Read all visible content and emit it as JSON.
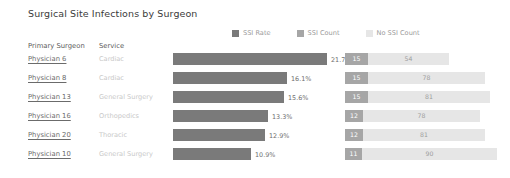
{
  "title": "Surgical Site Infections by Surgeon",
  "legend": {
    "items": [
      {
        "label": "SSI Rate",
        "color": "#7a7a7a"
      },
      {
        "label": "SSI Count",
        "color": "#a6a6a6"
      },
      {
        "label": "No SSI Count",
        "color": "#e6e6e6"
      }
    ]
  },
  "columns": {
    "surgeon": "Primary Surgeon",
    "service": "Service"
  },
  "chart_data": {
    "type": "bar",
    "title": "Surgical Site Infections by Surgeon",
    "xlabel": "",
    "ylabel": "",
    "categories": [
      "Physician 6",
      "Physician 8",
      "Physician 13",
      "Physician 16",
      "Physician 20",
      "Physician 10"
    ],
    "services": [
      "Cardiac",
      "Cardiac",
      "General Surgery",
      "Orthopedics",
      "Thoracic",
      "General Surgery"
    ],
    "series": [
      {
        "name": "SSI Rate",
        "values": [
          21.7,
          16.1,
          15.6,
          13.3,
          12.9,
          10.9
        ],
        "labels": [
          "21.7%",
          "16.1%",
          "15.6%",
          "13.3%",
          "12.9%",
          "10.9%"
        ],
        "color": "#7a7a7a",
        "unit": "%"
      },
      {
        "name": "SSI Count",
        "values": [
          15,
          15,
          15,
          12,
          12,
          11
        ],
        "color": "#a6a6a6"
      },
      {
        "name": "No SSI Count",
        "values": [
          54,
          78,
          81,
          78,
          81,
          90
        ],
        "color": "#e6e6e6"
      }
    ],
    "rate_axis_max": 22.5,
    "count_axis_max": 101,
    "grid": false,
    "legend_position": "top-right"
  },
  "rows": [
    {
      "surgeon": "Physician 6",
      "service": "Cardiac",
      "rate": 21.7,
      "rate_label": "21.7%",
      "ssi": 15,
      "nossi": 54
    },
    {
      "surgeon": "Physician 8",
      "service": "Cardiac",
      "rate": 16.1,
      "rate_label": "16.1%",
      "ssi": 15,
      "nossi": 78
    },
    {
      "surgeon": "Physician 13",
      "service": "General Surgery",
      "rate": 15.6,
      "rate_label": "15.6%",
      "ssi": 15,
      "nossi": 81
    },
    {
      "surgeon": "Physician 16",
      "service": "Orthopedics",
      "rate": 13.3,
      "rate_label": "13.3%",
      "ssi": 12,
      "nossi": 78
    },
    {
      "surgeon": "Physician 20",
      "service": "Thoracic",
      "rate": 12.9,
      "rate_label": "12.9%",
      "ssi": 12,
      "nossi": 81
    },
    {
      "surgeon": "Physician 10",
      "service": "General Surgery",
      "rate": 10.9,
      "rate_label": "10.9%",
      "ssi": 11,
      "nossi": 90
    }
  ]
}
